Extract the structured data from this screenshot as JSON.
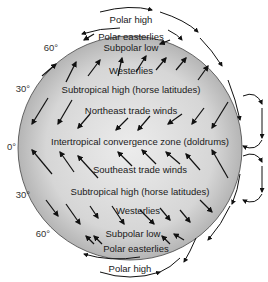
{
  "diagram": {
    "type": "global atmospheric circulation",
    "latitude_labels": {
      "north_60": "60°",
      "north_30": "30°",
      "equator": "0°",
      "south_30": "30°",
      "south_60": "60°"
    },
    "zones": {
      "polar_high_north": "Polar high",
      "polar_easterlies_north": "Polar easterlies",
      "subpolar_low_north": "Subpolar low",
      "westerlies_north": "Westerlies",
      "subtropical_high_north": "Subtropical high (horse latitudes)",
      "ne_trade_winds": "Northeast trade winds",
      "itcz": "Intertropical convergence zone (doldrums)",
      "se_trade_winds": "Southeast trade winds",
      "subtropical_high_south": "Subtropical high (horse latitudes)",
      "westerlies_south": "Westerlies",
      "subpolar_low_south": "Subpolar low",
      "polar_easterlies_south": "Polar easterlies",
      "polar_high_south": "Polar high"
    },
    "colors": {
      "globe_edge": "#bdbdbd",
      "globe_center": "#e6e6e6",
      "arrow": "#111111"
    }
  }
}
